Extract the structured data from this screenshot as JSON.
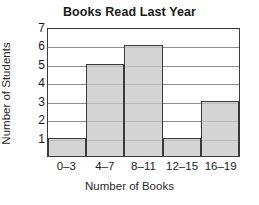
{
  "chart_data": {
    "type": "bar",
    "title": "Books Read Last Year",
    "xlabel": "Number of Books",
    "ylabel": "Number of Students",
    "categories": [
      "0–3",
      "4–7",
      "8–11",
      "12–15",
      "16–19"
    ],
    "values": [
      1,
      5,
      6,
      1,
      3
    ],
    "ylim": [
      0,
      7
    ],
    "ytick_labels": [
      "1",
      "2",
      "3",
      "4",
      "5",
      "6",
      "7"
    ],
    "ytick_values": [
      1,
      2,
      3,
      4,
      5,
      6,
      7
    ],
    "grid": true,
    "legend": false,
    "colors": {
      "bar_fill": "#c8c8c8",
      "bar_edge": "#3a3a3a",
      "gridline": "#8d8d8d",
      "axis": "#3a3a3a",
      "text": "#1a1a1a",
      "background": "#ffffff"
    }
  }
}
